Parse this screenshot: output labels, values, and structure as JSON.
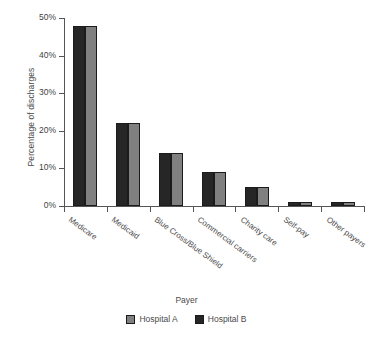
{
  "chart_data": {
    "type": "bar",
    "title": "",
    "subtitle": "",
    "xlabel": "Payer",
    "ylabel": "Percentage of discharges",
    "categories": [
      "Medicare",
      "Medicaid",
      "Blue Cross/Blue Shield",
      "Commercial carriers",
      "Charity care",
      "Self-pay",
      "Other payers"
    ],
    "series": [
      {
        "name": "Hospital B",
        "color": "#262626",
        "values": [
          48,
          22,
          14,
          9,
          5,
          1,
          1
        ]
      },
      {
        "name": "Hospital A",
        "color": "#808080",
        "values": [
          48,
          22,
          14,
          9,
          5,
          1,
          1
        ]
      }
    ],
    "ylim": [
      0,
      50
    ],
    "ytick_values": [
      0,
      10,
      20,
      30,
      40,
      50
    ],
    "ytick_labels": [
      "0%",
      "10%",
      "20%",
      "30%",
      "40%",
      "50%"
    ],
    "grid": false,
    "legend_position": "bottom",
    "bar_group_order": [
      "Hospital B",
      "Hospital A"
    ],
    "xtick_label_rotation": 36
  },
  "legend": {
    "entries": [
      {
        "label": "Hospital A",
        "color": "#808080"
      },
      {
        "label": "Hospital B",
        "color": "#262626"
      }
    ]
  },
  "colors": {
    "hospital_a": "#808080",
    "hospital_b": "#262626",
    "axis": "#555555",
    "text": "#4a4a4a",
    "background": "#ffffff"
  }
}
